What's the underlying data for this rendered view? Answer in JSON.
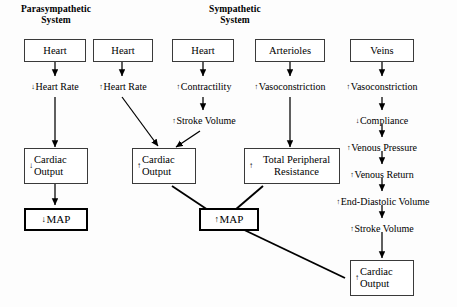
{
  "diagram": {
    "headers": [
      {
        "id": "parasympathetic",
        "line1": "Parasympathetic",
        "line2": "System"
      },
      {
        "id": "sympathetic",
        "line1": "Sympathetic",
        "line2": "System"
      }
    ],
    "top_boxes": [
      {
        "id": "heart-para",
        "label": "Heart"
      },
      {
        "id": "heart-symp-rate",
        "label": "Heart"
      },
      {
        "id": "heart-symp-contract",
        "label": "Heart"
      },
      {
        "id": "arterioles",
        "label": "Arterioles"
      },
      {
        "id": "veins",
        "label": "Veins"
      }
    ],
    "steps": [
      {
        "id": "dec-heart-rate",
        "arrow": "↓",
        "label": "Heart Rate"
      },
      {
        "id": "inc-heart-rate",
        "arrow": "↑",
        "label": "Heart Rate"
      },
      {
        "id": "inc-contractility",
        "arrow": "↑",
        "label": "Contractility"
      },
      {
        "id": "inc-stroke-volume-symp",
        "arrow": "↑",
        "label": "Stroke Volume"
      },
      {
        "id": "inc-vasoconstriction-art",
        "arrow": "↑",
        "label": "Vasoconstriction"
      },
      {
        "id": "inc-vasoconstriction-vein",
        "arrow": "↑",
        "label": "Vasoconstriction"
      },
      {
        "id": "dec-compliance",
        "arrow": "↓",
        "label": "Compliance"
      },
      {
        "id": "inc-venous-pressure",
        "arrow": "↑",
        "label": "Venous Pressure"
      },
      {
        "id": "inc-venous-return",
        "arrow": "↑",
        "label": "Venous Return"
      },
      {
        "id": "inc-end-diastolic-volume",
        "arrow": "↑",
        "label": "End-Diastolic Volume"
      },
      {
        "id": "inc-stroke-volume-vein",
        "arrow": "↑",
        "label": "Stroke Volume"
      }
    ],
    "outcome_boxes": [
      {
        "id": "cardiac-output-dec",
        "arrow": "↓",
        "line1": "Cardiac",
        "line2": "Output"
      },
      {
        "id": "cardiac-output-inc-mid",
        "arrow": "↑",
        "line1": "Cardiac",
        "line2": "Output"
      },
      {
        "id": "total-peripheral-resistance",
        "arrow": "↑",
        "line1": "Total Peripheral",
        "line2": "Resistance"
      },
      {
        "id": "cardiac-output-inc-right",
        "arrow": "↑",
        "line1": "Cardiac",
        "line2": "Output"
      }
    ],
    "map_boxes": [
      {
        "id": "map-decrease",
        "arrow": "↓",
        "label": "MAP"
      },
      {
        "id": "map-increase",
        "arrow": "↑",
        "label": "MAP"
      }
    ],
    "colors": {
      "ink": "#000000",
      "box_border": "#3a3a3a",
      "emphasis_border": "#000000",
      "background": "#fdfdfd"
    }
  }
}
